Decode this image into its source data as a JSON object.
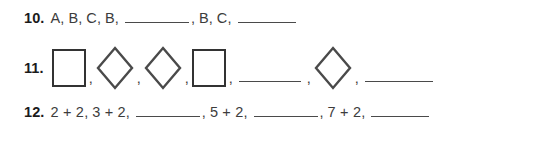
{
  "worksheet": {
    "background_color": "#ffffff",
    "text_color": "#3c3c3c",
    "number_color": "#1b1b1b",
    "shape_stroke_color": "#333333",
    "blank_line_color": "#4a4a4a"
  },
  "problems": [
    {
      "id": "10",
      "number_label": "10.",
      "type": "letter-pattern",
      "sequence_text": "A, B, C, B, ______, B, C, ______",
      "tokens": [
        {
          "kind": "text",
          "value": "A"
        },
        {
          "kind": "text",
          "value": "B"
        },
        {
          "kind": "text",
          "value": "C"
        },
        {
          "kind": "text",
          "value": "B"
        },
        {
          "kind": "blank",
          "value": ""
        },
        {
          "kind": "text",
          "value": "B"
        },
        {
          "kind": "text",
          "value": "C"
        },
        {
          "kind": "blank",
          "value": ""
        }
      ]
    },
    {
      "id": "11",
      "number_label": "11.",
      "type": "shape-pattern",
      "sequence_text": "square, diamond, diamond, square, ______, diamond, ______",
      "tokens": [
        {
          "kind": "square",
          "value": "square"
        },
        {
          "kind": "diamond",
          "value": "diamond"
        },
        {
          "kind": "diamond",
          "value": "diamond"
        },
        {
          "kind": "square",
          "value": "square"
        },
        {
          "kind": "blank",
          "value": ""
        },
        {
          "kind": "diamond",
          "value": "diamond"
        },
        {
          "kind": "blank",
          "value": ""
        }
      ]
    },
    {
      "id": "12",
      "number_label": "12.",
      "type": "expression-pattern",
      "sequence_text": "2 + 2, 3 + 2, ______, 5 + 2, ______, 7 + 2, ______",
      "tokens": [
        {
          "kind": "text",
          "value": "2 + 2"
        },
        {
          "kind": "text",
          "value": "3 + 2"
        },
        {
          "kind": "blank",
          "value": ""
        },
        {
          "kind": "text",
          "value": "5 + 2"
        },
        {
          "kind": "blank",
          "value": ""
        },
        {
          "kind": "text",
          "value": "7 + 2"
        },
        {
          "kind": "blank",
          "value": ""
        }
      ]
    }
  ],
  "punctuation": {
    "comma": ","
  }
}
